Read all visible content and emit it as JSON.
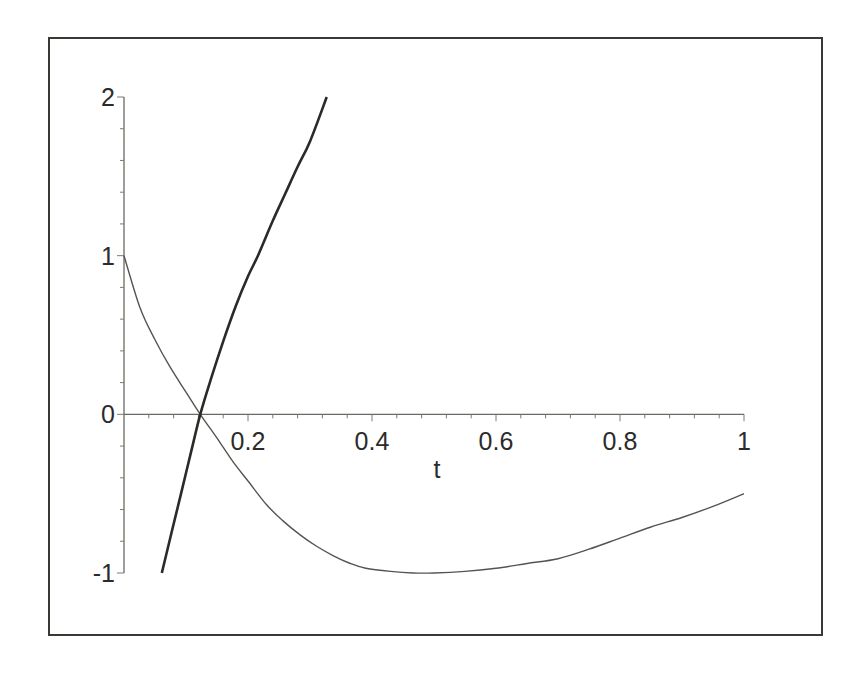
{
  "chart_data": {
    "type": "line",
    "title": "",
    "xlabel": "t",
    "ylabel": "",
    "xlim": [
      0,
      1
    ],
    "ylim": [
      -1,
      2
    ],
    "grid": false,
    "legend": "none",
    "x_ticks": [
      {
        "value": 0.2,
        "label": "0.2"
      },
      {
        "value": 0.4,
        "label": "0.4"
      },
      {
        "value": 0.6,
        "label": "0.6"
      },
      {
        "value": 0.8,
        "label": "0.8"
      },
      {
        "value": 1,
        "label": "1"
      }
    ],
    "x_minor_step": 0.04,
    "y_ticks": [
      {
        "value": -1,
        "label": "-1"
      },
      {
        "value": 0,
        "label": "0"
      },
      {
        "value": 1,
        "label": "1"
      },
      {
        "value": 2,
        "label": "2"
      }
    ],
    "y_minor_step": 0.2,
    "series": [
      {
        "name": "thin-curve",
        "style": "thin",
        "x": [
          0,
          0.026,
          0.05,
          0.074,
          0.1,
          0.123,
          0.15,
          0.176,
          0.2,
          0.23,
          0.256,
          0.284,
          0.31,
          0.337,
          0.365,
          0.39,
          0.43,
          0.466,
          0.5,
          0.55,
          0.6,
          0.65,
          0.7,
          0.75,
          0.8,
          0.85,
          0.9,
          0.95,
          1.0
        ],
        "y": [
          1.0,
          0.67,
          0.47,
          0.3,
          0.14,
          0.0,
          -0.15,
          -0.3,
          -0.42,
          -0.57,
          -0.67,
          -0.76,
          -0.83,
          -0.89,
          -0.94,
          -0.97,
          -0.99,
          -1.0,
          -1.0,
          -0.99,
          -0.97,
          -0.94,
          -0.91,
          -0.85,
          -0.78,
          -0.71,
          -0.65,
          -0.58,
          -0.5
        ]
      },
      {
        "name": "thick-curve",
        "style": "thick",
        "x": [
          0.061,
          0.077,
          0.092,
          0.108,
          0.123,
          0.14,
          0.16,
          0.18,
          0.2,
          0.216,
          0.24,
          0.26,
          0.28,
          0.3,
          0.327
        ],
        "y": [
          -1.0,
          -0.74,
          -0.5,
          -0.24,
          0.0,
          0.22,
          0.46,
          0.68,
          0.87,
          1.0,
          1.22,
          1.39,
          1.56,
          1.72,
          2.0
        ]
      }
    ]
  }
}
